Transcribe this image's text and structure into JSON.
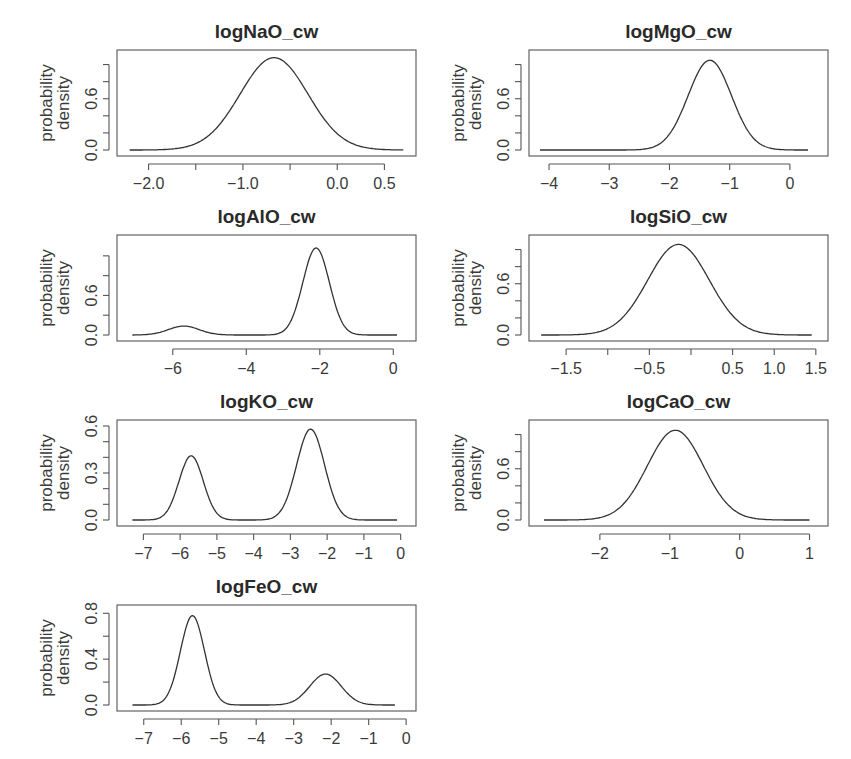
{
  "chart_data": [
    {
      "type": "line",
      "title": "logNaO_cw",
      "xlabel": "",
      "ylabel": "probability density",
      "xlim": [
        -2.25,
        0.75
      ],
      "ylim": [
        0,
        1.1
      ],
      "xticks": [
        -2.0,
        -1.5,
        -1.0,
        -0.5,
        0.0,
        0.5
      ],
      "xtick_labels": [
        "-2.0",
        "",
        "-1.0",
        "",
        "0.0",
        "0.5"
      ],
      "yticks": [
        0.0,
        0.2,
        0.4,
        0.6,
        0.8,
        1.0
      ],
      "ytick_labels": [
        "0.0",
        "",
        "",
        "0.6",
        "",
        ""
      ],
      "components": [
        {
          "mean": -0.67,
          "sd": 0.36,
          "peak": 1.08
        }
      ],
      "x": [
        -2.2,
        -1.8,
        -1.5,
        -1.2,
        -1.0,
        -0.85,
        -0.67,
        -0.5,
        -0.3,
        -0.1,
        0.1,
        0.4,
        0.7
      ],
      "y": [
        0.0,
        0.02,
        0.1,
        0.37,
        0.68,
        0.93,
        1.08,
        0.96,
        0.65,
        0.31,
        0.1,
        0.01,
        0.0
      ]
    },
    {
      "type": "line",
      "title": "logMgO_cw",
      "xlabel": "",
      "ylabel": "probability density",
      "xlim": [
        -4.2,
        0.5
      ],
      "ylim": [
        0,
        1.1
      ],
      "xticks": [
        -4,
        -3,
        -2,
        -1,
        0
      ],
      "xtick_labels": [
        "-4",
        "-3",
        "-2",
        "-1",
        "0"
      ],
      "yticks": [
        0.0,
        0.2,
        0.4,
        0.6,
        0.8,
        1.0
      ],
      "ytick_labels": [
        "0.0",
        "",
        "",
        "0.6",
        "",
        ""
      ],
      "components": [
        {
          "mean": -1.33,
          "sd": 0.36,
          "peak": 1.05
        }
      ],
      "x": [
        -4.15,
        -3.0,
        -2.5,
        -2.2,
        -2.0,
        -1.7,
        -1.33,
        -1.0,
        -0.8,
        -0.5,
        0.0,
        0.3
      ],
      "y": [
        0.0,
        0.0,
        0.02,
        0.12,
        0.26,
        0.62,
        1.05,
        0.7,
        0.3,
        0.06,
        0.0,
        0.0
      ]
    },
    {
      "type": "line",
      "title": "logAlO_cw",
      "xlabel": "",
      "ylabel": "probability density",
      "xlim": [
        -7.3,
        0.4
      ],
      "ylim": [
        0,
        0.95
      ],
      "xticks": [
        -6,
        -4,
        -2,
        0
      ],
      "xtick_labels": [
        "-6",
        "-4",
        "-2",
        "0"
      ],
      "yticks": [
        0.0,
        0.2,
        0.4,
        0.6,
        0.8
      ],
      "ytick_labels": [
        "0.0",
        "",
        "0.6",
        "",
        ""
      ],
      "components": [
        {
          "mean": -5.7,
          "sd": 0.42,
          "peak": 0.09
        },
        {
          "mean": -2.1,
          "sd": 0.36,
          "peak": 0.88
        }
      ],
      "x": [
        -7.1,
        -6.5,
        -5.7,
        -5.0,
        -4.0,
        -3.0,
        -2.6,
        -2.1,
        -1.6,
        -1.2,
        0.1
      ],
      "y": [
        0.0,
        0.02,
        0.09,
        0.02,
        0.0,
        0.06,
        0.35,
        0.88,
        0.35,
        0.05,
        0.0
      ]
    },
    {
      "type": "line",
      "title": "logSiO_cw",
      "xlabel": "",
      "ylabel": "probability density",
      "xlim": [
        -1.85,
        1.55
      ],
      "ylim": [
        0,
        1.1
      ],
      "xticks": [
        -1.5,
        -1.0,
        -0.5,
        0.0,
        0.5,
        1.0,
        1.5
      ],
      "xtick_labels": [
        "-1.5",
        "",
        "-0.5",
        "",
        "0.5",
        "1.0",
        "1.5"
      ],
      "yticks": [
        0.0,
        0.2,
        0.4,
        0.6,
        0.8,
        1.0
      ],
      "ytick_labels": [
        "0.0",
        "",
        "",
        "0.6",
        "",
        ""
      ],
      "components": [
        {
          "mean": -0.15,
          "sd": 0.37,
          "peak": 1.06
        }
      ],
      "x": [
        -1.8,
        -1.4,
        -1.0,
        -0.7,
        -0.4,
        -0.15,
        0.1,
        0.4,
        0.7,
        1.0,
        1.45
      ],
      "y": [
        0.0,
        0.02,
        0.15,
        0.42,
        0.84,
        1.06,
        0.84,
        0.35,
        0.08,
        0.01,
        0.0
      ]
    },
    {
      "type": "line",
      "title": "logKO_cw",
      "xlabel": "",
      "ylabel": "probability density",
      "xlim": [
        -7.5,
        0.2
      ],
      "ylim": [
        0,
        0.6
      ],
      "xticks": [
        -7,
        -6,
        -5,
        -4,
        -3,
        -2,
        -1,
        0
      ],
      "xtick_labels": [
        "-7",
        "-6",
        "-5",
        "-4",
        "-3",
        "-2",
        "-1",
        "0"
      ],
      "yticks": [
        0.0,
        0.1,
        0.2,
        0.3,
        0.4,
        0.5,
        0.6
      ],
      "ytick_labels": [
        "0.0",
        "",
        "",
        "0.3",
        "",
        "",
        "0.6"
      ],
      "components": [
        {
          "mean": -5.7,
          "sd": 0.33,
          "peak": 0.41
        },
        {
          "mean": -2.45,
          "sd": 0.38,
          "peak": 0.58
        }
      ],
      "x": [
        -7.3,
        -6.5,
        -6.0,
        -5.7,
        -5.4,
        -5.0,
        -4.0,
        -3.2,
        -2.8,
        -2.45,
        -2.1,
        -1.6,
        -0.1
      ],
      "y": [
        0.0,
        0.02,
        0.26,
        0.41,
        0.27,
        0.05,
        0.0,
        0.04,
        0.35,
        0.58,
        0.35,
        0.04,
        0.0
      ]
    },
    {
      "type": "line",
      "title": "logCaO_cw",
      "xlabel": "",
      "ylabel": "probability density",
      "xlim": [
        -2.9,
        1.15
      ],
      "ylim": [
        0,
        1.1
      ],
      "xticks": [
        -2,
        -1,
        0,
        1
      ],
      "xtick_labels": [
        "-2",
        "-1",
        "0",
        "1"
      ],
      "yticks": [
        0.0,
        0.2,
        0.4,
        0.6,
        0.8,
        1.0
      ],
      "ytick_labels": [
        "0.0",
        "",
        "",
        "0.6",
        "",
        ""
      ],
      "components": [
        {
          "mean": -0.92,
          "sd": 0.4,
          "peak": 1.05
        }
      ],
      "x": [
        -2.8,
        -2.2,
        -1.8,
        -1.5,
        -1.2,
        -0.92,
        -0.6,
        -0.3,
        0.0,
        0.4,
        1.0
      ],
      "y": [
        0.0,
        0.02,
        0.1,
        0.36,
        0.8,
        1.05,
        0.77,
        0.33,
        0.07,
        0.0,
        0.0
      ]
    },
    {
      "type": "line",
      "title": "logFeO_cw",
      "xlabel": "",
      "ylabel": "probability density",
      "xlim": [
        -7.5,
        0.05
      ],
      "ylim": [
        0,
        0.82
      ],
      "xticks": [
        -7,
        -6,
        -5,
        -4,
        -3,
        -2,
        -1,
        0
      ],
      "xtick_labels": [
        "-7",
        "-6",
        "-5",
        "-4",
        "-3",
        "-2",
        "-1",
        "0"
      ],
      "yticks": [
        0.0,
        0.2,
        0.4,
        0.6,
        0.8
      ],
      "ytick_labels": [
        "0.0",
        "",
        "0.4",
        "",
        "0.8"
      ],
      "components": [
        {
          "mean": -5.7,
          "sd": 0.32,
          "peak": 0.78
        },
        {
          "mean": -2.15,
          "sd": 0.42,
          "peak": 0.27
        }
      ],
      "x": [
        -7.3,
        -6.5,
        -6.0,
        -5.7,
        -5.4,
        -5.0,
        -4.0,
        -3.0,
        -2.15,
        -1.5,
        -0.3
      ],
      "y": [
        0.0,
        0.03,
        0.5,
        0.78,
        0.5,
        0.05,
        0.0,
        0.04,
        0.27,
        0.06,
        0.0
      ]
    }
  ],
  "panels": [
    {
      "title": "logNaO_cw",
      "ylabel_line1": "probability",
      "ylabel_line2": "density"
    },
    {
      "title": "logMgO_cw",
      "ylabel_line1": "probability",
      "ylabel_line2": "density"
    },
    {
      "title": "logAlO_cw",
      "ylabel_line1": "probability",
      "ylabel_line2": "density"
    },
    {
      "title": "logSiO_cw",
      "ylabel_line1": "probability",
      "ylabel_line2": "density"
    },
    {
      "title": "logKO_cw",
      "ylabel_line1": "probability",
      "ylabel_line2": "density"
    },
    {
      "title": "logCaO_cw",
      "ylabel_line1": "probability",
      "ylabel_line2": "density"
    },
    {
      "title": "logFeO_cw",
      "ylabel_line1": "probability",
      "ylabel_line2": "density"
    }
  ]
}
